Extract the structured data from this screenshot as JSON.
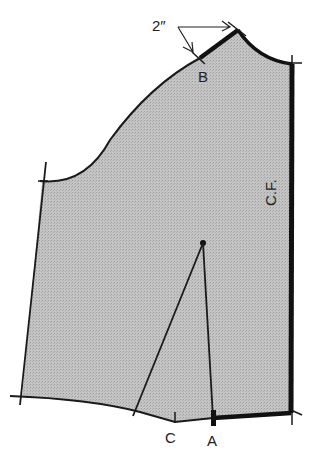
{
  "diagram": {
    "colors": {
      "fill": "#bdbdbd",
      "outline": "#1a1a1a",
      "background": "#ffffff"
    },
    "labels": {
      "measurement": "2″",
      "point_b": "B",
      "point_c": "C",
      "point_a": "A",
      "center_front": "C.F."
    }
  }
}
